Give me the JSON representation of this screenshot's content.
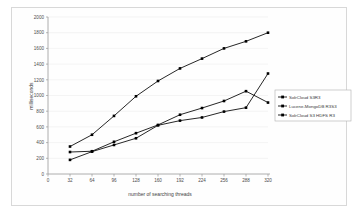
{
  "chart_data": {
    "type": "line",
    "title": "",
    "xlabel": "number of searching threads",
    "ylabel": "milliseconds",
    "x": [
      32,
      64,
      96,
      128,
      160,
      192,
      224,
      256,
      288,
      320
    ],
    "xlim": [
      0,
      320
    ],
    "ylim": [
      0,
      2000
    ],
    "xticks": [
      "0",
      "32",
      "64",
      "96",
      "128",
      "160",
      "192",
      "224",
      "256",
      "288",
      "320"
    ],
    "yticks": [
      "0",
      "200",
      "400",
      "600",
      "800",
      "1000",
      "1200",
      "1400",
      "1600",
      "1800",
      "2000"
    ],
    "grid": true,
    "legend_position": "right",
    "marker": "filled-square",
    "series": [
      {
        "name": "SolrCloud S3R3",
        "color": "#000000",
        "values": [
          350,
          500,
          740,
          990,
          1185,
          1345,
          1470,
          1600,
          1690,
          1800
        ]
      },
      {
        "name": "Lucene-MongoDB R3S3",
        "color": "#000000",
        "values": [
          180,
          285,
          370,
          455,
          620,
          680,
          720,
          795,
          845,
          1280
        ]
      },
      {
        "name": "SolrCloud S3 HDFS R3",
        "color": "#000000",
        "values": [
          280,
          290,
          410,
          520,
          625,
          755,
          840,
          930,
          1055,
          910
        ]
      }
    ]
  },
  "axes": {
    "y_label": "milliseconds",
    "x_label": "number of searching threads"
  },
  "legend": {
    "entries": [
      {
        "label": "SolrCloud S3R3"
      },
      {
        "label": "Lucene-MongoDB R3S3"
      },
      {
        "label": "SolrCloud S3 HDFS R3"
      }
    ]
  },
  "colors": {
    "series": "#000000",
    "grid": "#ececec",
    "axis": "#9a9a9a",
    "frame": "#d8d8d8",
    "background": "#ffffff",
    "text": "#4d4d4d"
  }
}
